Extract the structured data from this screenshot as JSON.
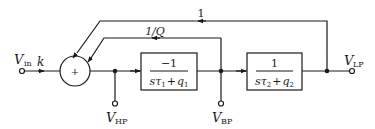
{
  "diagram": {
    "type": "block-diagram",
    "title": "",
    "input": {
      "symbol": "V",
      "subscript": "in",
      "gain": "k"
    },
    "summing_junction": {
      "sign": "+"
    },
    "blocks": [
      {
        "id": "integrator-1",
        "numerator": "−1",
        "denominator_s": "s",
        "denominator_tau": "τ",
        "tau_sub": "1",
        "denominator_plus": "+",
        "denominator_q": "q",
        "q_sub": "1"
      },
      {
        "id": "integrator-2",
        "numerator": "1",
        "denominator_s": "s",
        "denominator_tau": "τ",
        "tau_sub": "2",
        "denominator_plus": "+",
        "denominator_q": "q",
        "q_sub": "2"
      }
    ],
    "feedback": [
      {
        "from": "V_BP",
        "gain": "1/Q"
      },
      {
        "from": "V_LP",
        "gain": "1"
      }
    ],
    "outputs": {
      "hp": {
        "symbol": "V",
        "subscript": "HP"
      },
      "bp": {
        "symbol": "V",
        "subscript": "BP"
      },
      "lp": {
        "symbol": "V",
        "subscript": "LP"
      }
    },
    "colors": {
      "line": "#1a1a1a",
      "background": "#ffffff"
    }
  }
}
